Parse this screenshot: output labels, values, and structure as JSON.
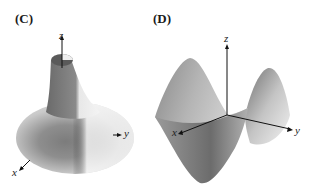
{
  "figure": {
    "panels": [
      {
        "id": "C",
        "label": "(C)",
        "surface": "funnel surface of revolution",
        "axes": {
          "x": "x",
          "y": "y",
          "z": "z"
        }
      },
      {
        "id": "D",
        "label": "(D)",
        "surface": "saddle surface",
        "axes": {
          "x": "x",
          "y": "y",
          "z": "z"
        }
      }
    ]
  }
}
